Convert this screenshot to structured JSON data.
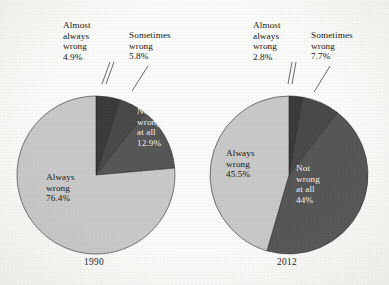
{
  "figure": {
    "background_color": "#fbfbf9",
    "palette": {
      "almost_always_wrong": "#3c3c3c",
      "sometimes_wrong": "#4a4a4a",
      "not_wrong_at_all": "#575757",
      "always_wrong": "#c9c9c9",
      "outline": "#2a2a2a",
      "text": "#161616",
      "text_on_dark": "#f2f2f2"
    }
  },
  "charts": [
    {
      "id": "pie-1990",
      "caption": "1990",
      "center": {
        "x": 96,
        "y": 175
      },
      "radius": 79,
      "labels": {
        "almost_always": {
          "l1": "Almost",
          "l2": "always",
          "l3": "wrong",
          "pct": "4.9%"
        },
        "sometimes": {
          "l1": "Sometimes",
          "l2": "wrong",
          "pct": "5.8%"
        },
        "not_wrong": {
          "l1": "Not",
          "l2": "wrong",
          "l3": "at all",
          "pct": "12.9%"
        },
        "always": {
          "l1": "Always",
          "l2": "wrong",
          "pct": "76.4%"
        }
      }
    },
    {
      "id": "pie-2012",
      "caption": "2012",
      "center": {
        "x": 289,
        "y": 175
      },
      "radius": 79,
      "labels": {
        "almost_always": {
          "l1": "Almost",
          "l2": "always",
          "l3": "wrong",
          "pct": "2.8%"
        },
        "sometimes": {
          "l1": "Sometimes",
          "l2": "wrong",
          "pct": "7.7%"
        },
        "not_wrong": {
          "l1": "Not",
          "l2": "wrong",
          "l3": "at all",
          "pct": "44%"
        },
        "always": {
          "l1": "Always",
          "l2": "wrong",
          "pct": "45.5%"
        }
      }
    }
  ],
  "chart_data": [
    {
      "type": "pie",
      "title": "1990",
      "categories": [
        "Almost always wrong",
        "Sometimes wrong",
        "Not wrong at all",
        "Always wrong"
      ],
      "values": [
        4.9,
        5.8,
        12.9,
        76.4
      ],
      "value_labels": [
        "4.9%",
        "5.8%",
        "12.9%",
        "76.4%"
      ],
      "colors": [
        "#3c3c3c",
        "#4a4a4a",
        "#575757",
        "#c9c9c9"
      ],
      "start_angle_deg": 0,
      "direction": "clockwise",
      "legend": "none",
      "label_placement": [
        "callout",
        "callout",
        "inside",
        "inside"
      ],
      "xlabel": "",
      "ylabel": ""
    },
    {
      "type": "pie",
      "title": "2012",
      "categories": [
        "Almost always wrong",
        "Sometimes wrong",
        "Not wrong at all",
        "Always wrong"
      ],
      "values": [
        2.8,
        7.7,
        44.0,
        45.5
      ],
      "value_labels": [
        "2.8%",
        "7.7%",
        "44%",
        "45.5%"
      ],
      "colors": [
        "#3c3c3c",
        "#4a4a4a",
        "#575757",
        "#c9c9c9"
      ],
      "start_angle_deg": 0,
      "direction": "clockwise",
      "legend": "none",
      "label_placement": [
        "callout",
        "callout",
        "inside",
        "inside"
      ],
      "xlabel": "",
      "ylabel": ""
    }
  ]
}
